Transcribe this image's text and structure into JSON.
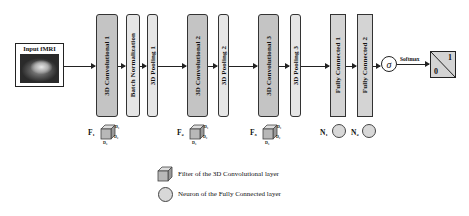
{
  "diagram": {
    "input": {
      "label": "Input fMRI",
      "image": "brain-mri-slice"
    },
    "layers": [
      {
        "id": "conv1",
        "label": "3D Convolutional 1",
        "type": "conv"
      },
      {
        "id": "bn",
        "label": "Batch Normalization",
        "type": "norm"
      },
      {
        "id": "pool1",
        "label": "3D Pooling 1",
        "type": "pool"
      },
      {
        "id": "conv2",
        "label": "3D Convolutional 2",
        "type": "conv"
      },
      {
        "id": "pool2",
        "label": "3D Pooling 2",
        "type": "pool"
      },
      {
        "id": "conv3",
        "label": "3D Convolutional 3",
        "type": "conv"
      },
      {
        "id": "pool3",
        "label": "3D Pooling 3",
        "type": "pool"
      },
      {
        "id": "fc1",
        "label": "Fully Connected 1",
        "type": "fc"
      },
      {
        "id": "fc2",
        "label": "Fully Connected 2",
        "type": "fc"
      }
    ],
    "activation": {
      "symbol": "σ",
      "label": "Softmax"
    },
    "output": {
      "top_value": "1",
      "bottom_value": "0"
    },
    "filters": [
      {
        "label": "F₁",
        "dims": [
          "D₁",
          "D₂",
          "D₃"
        ]
      },
      {
        "label": "F₂",
        "dims": [
          "D₁",
          "D₂",
          "D₃"
        ]
      },
      {
        "label": "F₃",
        "dims": [
          "D₁",
          "D₂",
          "D₃"
        ]
      }
    ],
    "neurons": [
      {
        "label": "N₁"
      },
      {
        "label": "N₂"
      }
    ],
    "legend": [
      {
        "icon": "cube-icon",
        "text": "Filter of the 3D Convolutional layer"
      },
      {
        "icon": "circle-icon",
        "text": "Neuron of the Fully Connected layer"
      }
    ],
    "colors": {
      "conv": "#c4c4c4",
      "pool": "#e6e6e6",
      "fc": "#dcdcdc",
      "stroke": "#222222"
    }
  }
}
